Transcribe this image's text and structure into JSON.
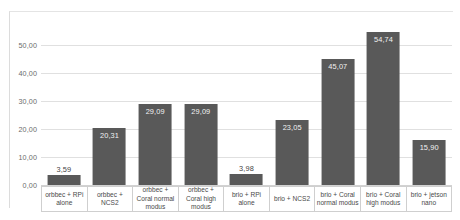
{
  "chart_data": {
    "type": "bar",
    "title": "",
    "xlabel": "",
    "ylabel": "",
    "ylim": [
      0,
      55
    ],
    "grid": true,
    "legend": "none",
    "decimal_separator": ",",
    "categories": [
      "orbbec + RPi alone",
      "orbbec + NCS2",
      "orbbec + Coral normal modus",
      "orbbec + Coral high modus",
      "brio + RPi alone",
      "brio + NCS2",
      "brio + Coral normal modus",
      "brio + Coral high modus",
      "brio + jetson nano"
    ],
    "values": [
      3.59,
      20.31,
      29.09,
      29.09,
      3.98,
      23.05,
      45.07,
      54.74,
      15.9
    ],
    "value_labels": [
      "3,59",
      "20,31",
      "29,09",
      "29,09",
      "3,98",
      "23,05",
      "45,07",
      "54,74",
      "15,90"
    ],
    "label_placement": [
      "above",
      "inside",
      "inside",
      "inside",
      "above",
      "inside",
      "inside",
      "inside",
      "inside"
    ],
    "y_ticks": [
      0,
      10,
      20,
      30,
      40,
      50
    ],
    "y_tick_labels": [
      "0,00",
      "10,00",
      "20,00",
      "30,00",
      "40,00",
      "50,00"
    ],
    "bar_color": "#595959",
    "gridline_color": "#e0e0e0",
    "value_label_color": "#3f3f3f",
    "tick_label_color": "#6b6b6b"
  }
}
